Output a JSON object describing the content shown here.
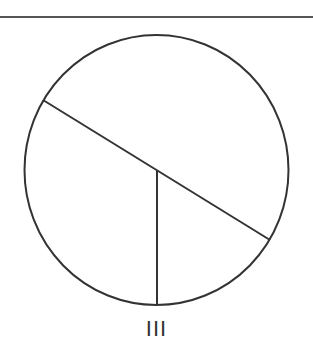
{
  "figure": {
    "label": "III",
    "stroke_color": "#333333",
    "background": "#ffffff",
    "top_rule": {
      "x1": 0,
      "y1": 17,
      "x2": 313,
      "y2": 17
    },
    "circle": {
      "cx": 156.5,
      "cy": 170,
      "rx": 132,
      "ry": 135
    },
    "chord": {
      "x1": 43,
      "y1": 100,
      "x2": 270,
      "y2": 240
    },
    "radius_line": {
      "x1": 157,
      "y1": 170,
      "x2": 157,
      "y2": 305
    }
  }
}
